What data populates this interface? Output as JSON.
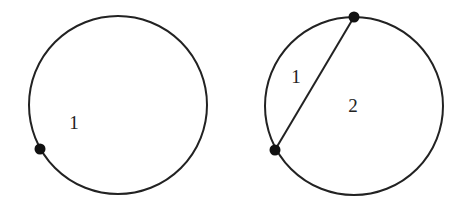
{
  "diagrams": [
    {
      "name": "circle-one-point",
      "circle": {
        "cx": 118,
        "cy": 105,
        "r": 89
      },
      "points": [
        {
          "x": 40,
          "y": 149
        }
      ],
      "chords": [],
      "regions": [
        {
          "label": "1",
          "x": 74,
          "y": 129
        }
      ]
    },
    {
      "name": "circle-two-points",
      "circle": {
        "cx": 354,
        "cy": 106,
        "r": 89
      },
      "points": [
        {
          "x": 354,
          "y": 17
        },
        {
          "x": 275,
          "y": 150
        }
      ],
      "chords": [
        {
          "x1": 354,
          "y1": 17,
          "x2": 275,
          "y2": 150
        }
      ],
      "regions": [
        {
          "label": "1",
          "x": 296,
          "y": 83
        },
        {
          "label": "2",
          "x": 353,
          "y": 112
        }
      ]
    }
  ],
  "colors": {
    "stroke": "#222222",
    "point": "#111111",
    "background": "#ffffff"
  }
}
